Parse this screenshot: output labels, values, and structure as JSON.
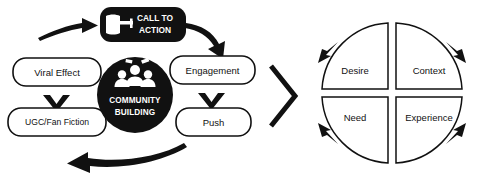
{
  "diagram": {
    "colors": {
      "ink": "#111111",
      "paper": "#ffffff",
      "cta_fill": "#111111",
      "cta_text": "#ffffff",
      "hub_fill": "#111111",
      "hub_text": "#ffffff"
    },
    "left_cycle": {
      "cta": {
        "line1": "CALL TO",
        "line2": "ACTION",
        "icon": "pointing-hand-icon"
      },
      "hub": {
        "line1": "COMMUNITY",
        "line2": "BUILDING",
        "icon": "people-group-icon"
      },
      "nodes": [
        {
          "id": "viral-effect",
          "label": "Viral Effect"
        },
        {
          "id": "ugc-fan-fiction",
          "label": "UGC/Fan Fiction"
        },
        {
          "id": "engagement",
          "label": "Engagement"
        },
        {
          "id": "push",
          "label": "Push"
        }
      ],
      "connectors": [
        {
          "id": "arrow-into-cta",
          "shape": "curved-arrow-right"
        },
        {
          "id": "arrow-cta-to-engagement",
          "shape": "curved-arrow-down-right"
        },
        {
          "id": "arrow-engagement-to-push",
          "shape": "chevron-down"
        },
        {
          "id": "arrow-viral-to-ugc",
          "shape": "chevron-down"
        },
        {
          "id": "arrow-bottom-return",
          "shape": "curved-arrow-left"
        }
      ]
    },
    "bridge": {
      "id": "chevron-right-connector",
      "shape": "chevron-right"
    },
    "right_cycle": {
      "quadrants": [
        {
          "id": "desire",
          "label": "Desire",
          "position": "top-left"
        },
        {
          "id": "context",
          "label": "Context",
          "position": "top-right"
        },
        {
          "id": "need",
          "label": "Need",
          "position": "bottom-left"
        },
        {
          "id": "experience",
          "label": "Experience",
          "position": "bottom-right"
        }
      ],
      "arcs": [
        {
          "id": "arc-top-left",
          "arrow": "up-right"
        },
        {
          "id": "arc-top-right",
          "arrow": "down-right"
        },
        {
          "id": "arc-bottom-right",
          "arrow": "down-left"
        },
        {
          "id": "arc-bottom-left",
          "arrow": "up-left"
        }
      ]
    }
  }
}
